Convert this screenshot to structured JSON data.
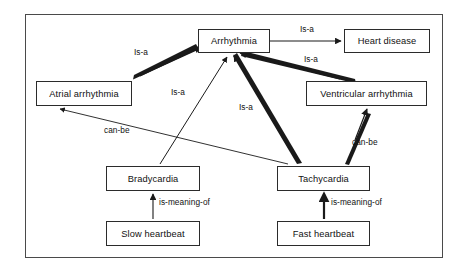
{
  "diagram": {
    "frame": {
      "x": 25,
      "y": 14,
      "width": 418,
      "height": 244,
      "border_color": "#4a4a4a"
    },
    "background_color": "#ffffff",
    "line_color": "#1a1a1a",
    "nodes": [
      {
        "id": "arrhythmia",
        "label": "Arrhythmia",
        "x": 198,
        "y": 29,
        "width": 72,
        "height": 24
      },
      {
        "id": "heart-disease",
        "label": "Heart disease",
        "x": 344,
        "y": 29,
        "width": 86,
        "height": 24
      },
      {
        "id": "atrial-arrhythmia",
        "label": "Atrial arrhythmia",
        "x": 36,
        "y": 81,
        "width": 96,
        "height": 25
      },
      {
        "id": "ventricular-arrhythmia",
        "label": "Ventricular arrhythmia",
        "x": 306,
        "y": 81,
        "width": 121,
        "height": 25
      },
      {
        "id": "bradycardia",
        "label": "Bradycardia",
        "x": 106,
        "y": 166,
        "width": 94,
        "height": 25
      },
      {
        "id": "tachycardia",
        "label": "Tachycardia",
        "x": 277,
        "y": 166,
        "width": 93,
        "height": 25
      },
      {
        "id": "slow-heartbeat",
        "label": "Slow heartbeat",
        "x": 106,
        "y": 221,
        "width": 94,
        "height": 25
      },
      {
        "id": "fast-heartbeat",
        "label": "Fast heartbeat",
        "x": 277,
        "y": 221,
        "width": 93,
        "height": 25
      }
    ],
    "edges": [
      {
        "id": "arrhythmia-to-heart-disease",
        "from": "arrhythmia",
        "to": "heart-disease",
        "label": "Is-a",
        "weight": "thin"
      },
      {
        "id": "atrial-to-arrhythmia",
        "from": "atrial-arrhythmia",
        "to": "arrhythmia",
        "label": "Is-a",
        "weight": "thick"
      },
      {
        "id": "ventricular-to-arrhythmia",
        "from": "ventricular-arrhythmia",
        "to": "arrhythmia",
        "label": "Is-a",
        "weight": "thick"
      },
      {
        "id": "bradycardia-to-arrhythmia",
        "from": "bradycardia",
        "to": "arrhythmia",
        "label": "Is-a",
        "weight": "thin"
      },
      {
        "id": "tachycardia-to-arrhythmia",
        "from": "tachycardia",
        "to": "arrhythmia",
        "label": "Is-a",
        "weight": "thick"
      },
      {
        "id": "tachycardia-to-atrial",
        "from": "tachycardia",
        "to": "atrial-arrhythmia",
        "label": "can-be",
        "weight": "thin"
      },
      {
        "id": "tachycardia-to-ventricular",
        "from": "tachycardia",
        "to": "ventricular-arrhythmia",
        "label": "can-be",
        "weight": "thick"
      },
      {
        "id": "slow-heartbeat-to-bradycardia",
        "from": "slow-heartbeat",
        "to": "bradycardia",
        "label": "is-meaning-of",
        "weight": "thin"
      },
      {
        "id": "fast-heartbeat-to-tachycardia",
        "from": "fast-heartbeat",
        "to": "tachycardia",
        "label": "is-meaning-of",
        "weight": "thick"
      }
    ],
    "edge_labels": [
      {
        "id": "label-arrhythmia-heart-disease",
        "text": "Is-a",
        "x": 300,
        "y": 24
      },
      {
        "id": "label-atrial-arrhythmia",
        "text": "Is-a",
        "x": 134,
        "y": 47
      },
      {
        "id": "label-ventricular-arrhythmia",
        "text": "Is-a",
        "x": 304,
        "y": 54
      },
      {
        "id": "label-bradycardia-arrhythmia",
        "text": "Is-a",
        "x": 171,
        "y": 87
      },
      {
        "id": "label-tachycardia-arrhythmia",
        "text": "Is-a",
        "x": 239,
        "y": 102
      },
      {
        "id": "label-tachycardia-atrial",
        "text": "can-be",
        "x": 104,
        "y": 125
      },
      {
        "id": "label-tachycardia-ventricular",
        "text": "can-be",
        "x": 352,
        "y": 137
      },
      {
        "id": "label-slow-heartbeat",
        "text": "is-meaning-of",
        "x": 159,
        "y": 197
      },
      {
        "id": "label-fast-heartbeat",
        "text": "is-meaning-of",
        "x": 331,
        "y": 197
      }
    ]
  }
}
